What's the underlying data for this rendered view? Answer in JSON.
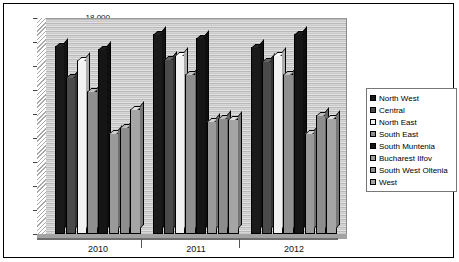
{
  "chart_data": {
    "type": "bar",
    "title": "",
    "xlabel": "",
    "ylabel": "",
    "categories": [
      "2010",
      "2011",
      "2012"
    ],
    "ylim": [
      0,
      18000
    ],
    "ytick_labels": [
      "18,000",
      "16,000",
      "14,000",
      "12,000",
      "10,000",
      "8000",
      "6000",
      "4000",
      "2000",
      "0"
    ],
    "ytick_values": [
      18000,
      16000,
      14000,
      12000,
      10000,
      8000,
      6000,
      4000,
      2000,
      0
    ],
    "grid": true,
    "legend_position": "right",
    "series": [
      {
        "name": "North West",
        "color": "#1a1a1a",
        "values": [
          15700,
          16700,
          15600
        ]
      },
      {
        "name": "Central",
        "color": "#4a4a4a",
        "values": [
          13100,
          14600,
          14400
        ]
      },
      {
        "name": "North East",
        "color": "#f2f2f2",
        "values": [
          14500,
          14900,
          14900
        ]
      },
      {
        "name": "South East",
        "color": "#8f8f8f",
        "values": [
          11900,
          13300,
          13300
        ]
      },
      {
        "name": "South Muntenia",
        "color": "#151515",
        "values": [
          15400,
          16300,
          16700
        ]
      },
      {
        "name": "Bucharest Ilfov",
        "color": "#9a9a9a",
        "values": [
          8400,
          9400,
          8400
        ]
      },
      {
        "name": "South West Oltenia",
        "color": "#8d8d8d",
        "values": [
          8900,
          9700,
          9900
        ]
      },
      {
        "name": "West",
        "color": "#a5a5a5",
        "values": [
          10400,
          9600,
          9700
        ]
      }
    ]
  },
  "legend": {
    "title": "",
    "items": [
      {
        "label": "North West"
      },
      {
        "label": "Central"
      },
      {
        "label": "North East"
      },
      {
        "label": "South East"
      },
      {
        "label": "South Muntenia"
      },
      {
        "label": "Bucharest Ilfov"
      },
      {
        "label": "South West Oltenia"
      },
      {
        "label": "West"
      }
    ]
  }
}
